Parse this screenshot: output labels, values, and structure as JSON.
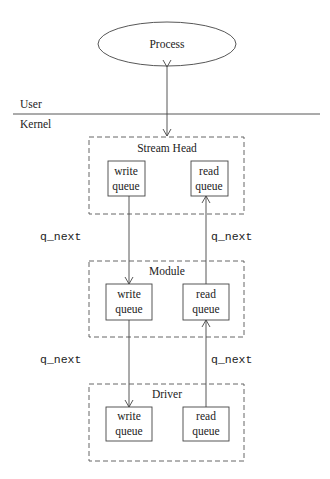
{
  "diagram": {
    "process": {
      "label": "Process"
    },
    "boundary": {
      "user_label": "User",
      "kernel_label": "Kernel"
    },
    "layers": [
      {
        "name": "Stream Head",
        "write_line1": "write",
        "write_line2": "queue",
        "read_line1": "read",
        "read_line2": "queue"
      },
      {
        "name": "Module",
        "write_line1": "write",
        "write_line2": "queue",
        "read_line1": "read",
        "read_line2": "queue"
      },
      {
        "name": "Driver",
        "write_line1": "write",
        "write_line2": "queue",
        "read_line1": "read",
        "read_line2": "queue"
      }
    ],
    "links": [
      {
        "left": "q_next",
        "right": "q_next"
      },
      {
        "left": "q_next",
        "right": "q_next"
      }
    ]
  }
}
